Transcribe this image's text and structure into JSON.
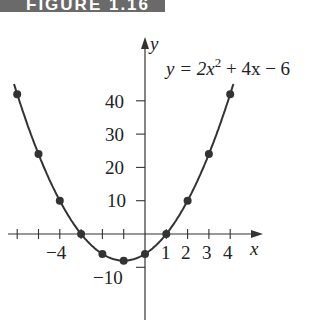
{
  "banner": {
    "label": "FIGURE 1.16"
  },
  "chart_data": {
    "type": "line",
    "title": "",
    "equation": "y = 2x² + 4x − 6",
    "equation_parts": {
      "lhs": "y = 2x",
      "sup": "2",
      "rhs": " + 4x − 6"
    },
    "xlabel": "x",
    "ylabel": "y",
    "x": [
      -4.6,
      -4,
      -3,
      -2,
      -1,
      0,
      1,
      2,
      3,
      4,
      4.6
    ],
    "series": [
      {
        "name": "y = 2x^2 + 4x - 6",
        "points": [
          [
            -4,
            10
          ],
          [
            -3,
            0
          ],
          [
            -2,
            -6
          ],
          [
            -1,
            -8
          ],
          [
            0,
            -6
          ],
          [
            1,
            0
          ],
          [
            2,
            10
          ],
          [
            3,
            24
          ],
          [
            4,
            42
          ],
          [
            -5,
            24
          ],
          [
            -6,
            42
          ]
        ]
      }
    ],
    "marked_points_x": [
      -6,
      -5,
      -4,
      -3,
      -2,
      -1,
      0,
      1,
      2,
      3,
      4
    ],
    "x_ticks": [
      -6,
      -5,
      -4,
      -3,
      -2,
      -1,
      1,
      2,
      3,
      4
    ],
    "x_tick_labels": {
      "neg4": "−4",
      "p1": "1",
      "p2": "2",
      "p3": "3",
      "p4": "4"
    },
    "y_ticks": [
      -10,
      10,
      20,
      30,
      40
    ],
    "y_tick_labels": {
      "n10": "−10",
      "p10": "10",
      "p20": "20",
      "p30": "30",
      "p40": "40"
    },
    "grid": false,
    "curve_color": "#333333"
  }
}
